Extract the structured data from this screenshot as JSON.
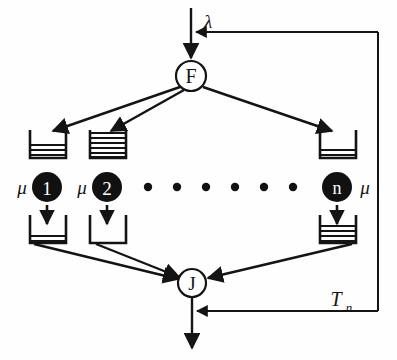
{
  "diagram": {
    "type": "fork-join-queueing-network",
    "background_color": "#fefefe",
    "stroke_color": "#141414",
    "node_fill_white": "#ffffff",
    "server_fill_black": "#111111"
  },
  "labels": {
    "arrival_rate": "λ",
    "fork_node": "F",
    "join_node": "J",
    "service_rate": "μ",
    "feedback": "T",
    "feedback_subscript": "n"
  },
  "fork": {
    "name": "F",
    "label": "F",
    "cx": 191,
    "cy": 76,
    "r": 15
  },
  "join": {
    "name": "J",
    "label": "J",
    "cx": 192,
    "cy": 283,
    "r": 14
  },
  "arrival": {
    "label": "λ",
    "label_x": 208,
    "label_y": 23,
    "line_x": 191,
    "line_y_start": 8,
    "line_y_end": 61
  },
  "servers": [
    {
      "id": "1",
      "label": "1",
      "rate_label": "μ",
      "rate_side": "left",
      "cx": 47,
      "cy": 187,
      "r": 15,
      "in_buffer": {
        "x": 30,
        "y": 130,
        "w": 36,
        "h": 28,
        "fill_lines": 3
      },
      "out_buffer": {
        "x": 30,
        "y": 215,
        "w": 36,
        "h": 28,
        "fill_lines": 2
      }
    },
    {
      "id": "2",
      "label": "2",
      "rate_label": "μ",
      "rate_side": "left",
      "cx": 107,
      "cy": 187,
      "r": 15,
      "in_buffer": {
        "x": 90,
        "y": 130,
        "w": 36,
        "h": 28,
        "fill_lines": 6
      },
      "out_buffer": {
        "x": 90,
        "y": 215,
        "w": 36,
        "h": 28,
        "fill_lines": 0
      }
    },
    {
      "id": "n",
      "label": "n",
      "rate_label": "μ",
      "rate_side": "right",
      "cx": 337,
      "cy": 187,
      "r": 15,
      "in_buffer": {
        "x": 320,
        "y": 130,
        "w": 36,
        "h": 28,
        "fill_lines": 2
      },
      "out_buffer": {
        "x": 320,
        "y": 215,
        "w": 36,
        "h": 28,
        "fill_lines": 4
      }
    }
  ],
  "ellipsis_dots": {
    "count": 6,
    "y": 187,
    "x_positions": [
      148,
      177,
      206,
      235,
      264,
      293
    ],
    "radius": 4
  },
  "feedback_loop": {
    "label": "T",
    "subscript": "n",
    "label_x": 340,
    "label_y": 302,
    "vertical_x": 378,
    "top_y": 32,
    "bottom_y": 311,
    "enters_fork_at_y": 32,
    "leaves_join_at_y": 311
  },
  "output": {
    "x": 192,
    "y_start": 297,
    "y_end": 350
  }
}
